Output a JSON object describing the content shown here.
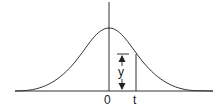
{
  "diagram": {
    "type": "normal-distribution-curve",
    "labels": {
      "origin": "0",
      "t": "t",
      "y": "y"
    },
    "colors": {
      "stroke": "#333333",
      "background": "#ffffff"
    }
  }
}
